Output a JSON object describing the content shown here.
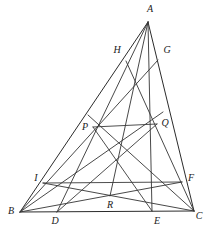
{
  "figure": {
    "caption": "",
    "stroke_color": "#2b2b2b",
    "background_color": "#ffffff",
    "label_color": "#1a1a1a"
  },
  "points": {
    "A": {
      "label": "A",
      "x": 148,
      "y": 22,
      "lx": 150,
      "ly": 9
    },
    "B": {
      "label": "B",
      "x": 20,
      "y": 212,
      "lx": 11,
      "ly": 211
    },
    "C": {
      "label": "C",
      "x": 194,
      "y": 211,
      "lx": 199,
      "ly": 216
    },
    "D": {
      "label": "D",
      "x": 57,
      "y": 212,
      "lx": 55,
      "ly": 221
    },
    "E": {
      "label": "E",
      "x": 152,
      "y": 211,
      "lx": 157,
      "ly": 221
    },
    "F": {
      "label": "F",
      "x": 182,
      "y": 182,
      "lx": 191,
      "ly": 178
    },
    "G": {
      "label": "G",
      "x": 158,
      "y": 60,
      "lx": 167,
      "ly": 50
    },
    "H": {
      "label": "H",
      "x": 126,
      "y": 61,
      "lx": 117,
      "ly": 50
    },
    "I": {
      "label": "I",
      "x": 43,
      "y": 183,
      "lx": 36,
      "ly": 178
    },
    "P": {
      "label": "P",
      "x": 93,
      "y": 127,
      "lx": 85,
      "ly": 127
    },
    "Q": {
      "label": "Q",
      "x": 157,
      "y": 124,
      "lx": 165,
      "ly": 123
    },
    "R": {
      "label": "R",
      "x": 110,
      "y": 196,
      "lx": 110,
      "ly": 205
    }
  },
  "segments": {
    "sides": [
      {
        "name": "side-AB",
        "from": "A",
        "to": "B"
      },
      {
        "name": "side-AC",
        "from": "A",
        "to": "C"
      },
      {
        "name": "side-BC",
        "from": "B",
        "to": "C"
      }
    ],
    "cevians": [
      {
        "name": "cevian-A-D",
        "from": "A",
        "to": "D"
      },
      {
        "name": "cevian-A-E",
        "from": "A",
        "to": "E"
      },
      {
        "name": "cevian-A-R",
        "from": "A",
        "to": "R"
      },
      {
        "name": "cevian-B-G",
        "from": "B",
        "to": "G"
      },
      {
        "name": "cevian-B-Q",
        "from": "B",
        "to": "Q"
      },
      {
        "name": "cevian-B-F",
        "from": "B",
        "to": "F"
      },
      {
        "name": "cevian-C-H",
        "from": "C",
        "to": "H"
      },
      {
        "name": "cevian-C-P",
        "from": "C",
        "to": "P"
      },
      {
        "name": "cevian-C-I",
        "from": "C",
        "to": "I"
      }
    ],
    "connectors": [
      {
        "name": "segment-P-Q",
        "from": "P",
        "to": "Q"
      },
      {
        "name": "segment-I-F",
        "from": "I",
        "to": "F"
      },
      {
        "name": "segment-P-E",
        "from": "P",
        "to": "E"
      },
      {
        "name": "segment-Q-D",
        "from": "Q",
        "to": "D"
      }
    ]
  }
}
